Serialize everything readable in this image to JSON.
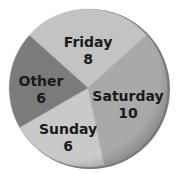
{
  "chart_data": {
    "type": "pie",
    "title": "",
    "categories": [
      "Friday",
      "Saturday",
      "Sunday",
      "Other"
    ],
    "values": [
      8,
      10,
      6,
      6
    ],
    "total": 30,
    "colors": [
      "#c3c3c3",
      "#a9a9a9",
      "#c9c9c9",
      "#7b7b7b"
    ],
    "start_angle_deg": 312,
    "direction": "clockwise",
    "legend": "none (labels inside slices)",
    "slices": [
      {
        "label": "Friday",
        "value": 8,
        "value_text": "8",
        "color": "#c3c3c3"
      },
      {
        "label": "Saturday",
        "value": 10,
        "value_text": "10",
        "color": "#a9a9a9"
      },
      {
        "label": "Sunday",
        "value": 6,
        "value_text": "6",
        "color": "#c9c9c9"
      },
      {
        "label": "Other",
        "value": 6,
        "value_text": "6",
        "color": "#7b7b7b"
      }
    ]
  },
  "style": {
    "rim_color": "#8e8e8e",
    "shadow_color": "#6f6f6f",
    "label_color": "#1a1a1a"
  }
}
